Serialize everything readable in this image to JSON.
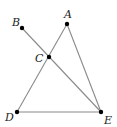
{
  "diagram": {
    "type": "geometry",
    "line_color": "#8a8a8a",
    "point_color": "#000000",
    "points": [
      {
        "id": "A",
        "label": "A",
        "x": 67,
        "y": 24,
        "label_x": 64,
        "label_y": 18
      },
      {
        "id": "B",
        "label": "B",
        "x": 22,
        "y": 28,
        "label_x": 12,
        "label_y": 26
      },
      {
        "id": "C",
        "label": "C",
        "x": 49,
        "y": 57,
        "label_x": 35,
        "label_y": 62
      },
      {
        "id": "D",
        "label": "D",
        "x": 17,
        "y": 112,
        "label_x": 5,
        "label_y": 121
      },
      {
        "id": "E",
        "label": "E",
        "x": 101,
        "y": 112,
        "label_x": 104,
        "label_y": 124
      }
    ],
    "segments": [
      {
        "from": "B",
        "to": "E"
      },
      {
        "from": "A",
        "to": "D"
      },
      {
        "from": "A",
        "to": "E"
      },
      {
        "from": "D",
        "to": "E"
      }
    ]
  }
}
